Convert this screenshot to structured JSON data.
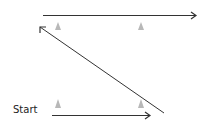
{
  "diagram": {
    "start_label": "Start",
    "colors": {
      "line": "#333333",
      "cone": "#b0b0b0",
      "background": "#ffffff"
    },
    "nodes": [
      {
        "id": "cone-bottom-left",
        "type": "cone",
        "x": 58,
        "y": 103
      },
      {
        "id": "cone-bottom-right",
        "type": "cone",
        "x": 141,
        "y": 103
      },
      {
        "id": "cone-top-left",
        "type": "cone",
        "x": 58,
        "y": 26
      },
      {
        "id": "cone-top-right",
        "type": "cone",
        "x": 141,
        "y": 26
      }
    ],
    "edges": [
      {
        "id": "path-1",
        "from": [
          52,
          115
        ],
        "to": [
          150,
          115
        ],
        "arrow": "end"
      },
      {
        "id": "path-2",
        "from": [
          164,
          113
        ],
        "to": [
          40,
          27
        ],
        "arrow": "end"
      },
      {
        "id": "path-3",
        "from": [
          43,
          15
        ],
        "to": [
          196,
          15
        ],
        "arrow": "end"
      }
    ]
  }
}
